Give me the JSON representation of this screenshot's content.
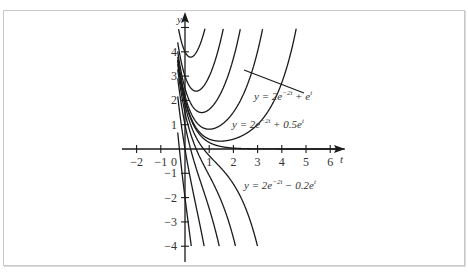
{
  "chart_data": {
    "type": "line",
    "title": "",
    "xlabel": "t",
    "ylabel": "y",
    "xlim": [
      -2.6,
      6.6
    ],
    "ylim": [
      -4.6,
      5.3
    ],
    "x_ticks": [
      -2,
      -1,
      0,
      1,
      2,
      3,
      4,
      5,
      6
    ],
    "y_ticks": [
      -4,
      -3,
      -2,
      -1,
      1,
      2,
      3,
      4,
      5
    ],
    "x_tick_labels": [
      "−2",
      "−1",
      "0",
      "1",
      "2",
      "3",
      "4",
      "5",
      "6"
    ],
    "y_tick_labels": [
      "−4",
      "−3",
      "−2",
      "−1",
      "1",
      "2",
      "3",
      "4",
      ""
    ],
    "grid": false,
    "family": "y = 2e^(-2t) + c e^t",
    "series": [
      {
        "name": "c=2",
        "c": 2
      },
      {
        "name": "y = 2e^(-2t) + e^t",
        "c": 1
      },
      {
        "name": "y = 2e^(-2t) + 0.5e^t",
        "c": 0.5
      },
      {
        "name": "c=0.2",
        "c": 0.2
      },
      {
        "name": "c=0.05",
        "c": 0.05
      },
      {
        "name": "c=0",
        "c": 0
      },
      {
        "name": "y = 2e^(-2t) - 0.2e^t",
        "c": -0.2
      },
      {
        "name": "c=-0.5",
        "c": -0.5
      },
      {
        "name": "c=-1",
        "c": -1
      },
      {
        "name": "c=-2",
        "c": -2
      },
      {
        "name": "c=-4",
        "c": -4
      }
    ],
    "annotations": [
      {
        "text_main": "y = 2e",
        "sup": "−2t",
        "tail": " + e",
        "tail_sup": "t",
        "points_to_c": 1
      },
      {
        "text_main": "y = 2e",
        "sup": "−2t",
        "tail": " + 0.5e",
        "tail_sup": "t"
      },
      {
        "text_main": "y = 2e",
        "sup": "−2t",
        "tail": " − 0.2e",
        "tail_sup": "t"
      }
    ]
  },
  "axes": {
    "x_label": "t",
    "y_label": "y"
  },
  "colors": {
    "curve": "#1a1a1a",
    "axis": "#1a1a1a",
    "frame": "#c8c8c8"
  }
}
